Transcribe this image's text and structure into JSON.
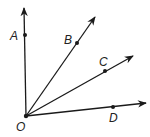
{
  "diagram": {
    "type": "rays-from-common-vertex",
    "stroke_color": "#1a1a1a",
    "background": "#ffffff",
    "vertex": {
      "label": "O",
      "x": 26,
      "y": 116,
      "label_x": 16,
      "label_y": 131
    },
    "rays": [
      {
        "id": "OA",
        "end_x": 24,
        "end_y": 8,
        "point": {
          "label": "A",
          "x": 25,
          "y": 35,
          "label_x": 10,
          "label_y": 40
        }
      },
      {
        "id": "OB",
        "end_x": 95,
        "end_y": 17,
        "point": {
          "label": "B",
          "x": 77,
          "y": 43,
          "label_x": 64,
          "label_y": 44
        }
      },
      {
        "id": "OC",
        "end_x": 133,
        "end_y": 56,
        "point": {
          "label": "C",
          "x": 105,
          "y": 71,
          "label_x": 99,
          "label_y": 66
        }
      },
      {
        "id": "OD",
        "end_x": 146,
        "end_y": 103,
        "point": {
          "label": "D",
          "x": 113,
          "y": 107,
          "label_x": 109,
          "label_y": 122
        }
      }
    ]
  },
  "labels": {
    "O": "O",
    "A": "A",
    "B": "B",
    "C": "C",
    "D": "D"
  }
}
